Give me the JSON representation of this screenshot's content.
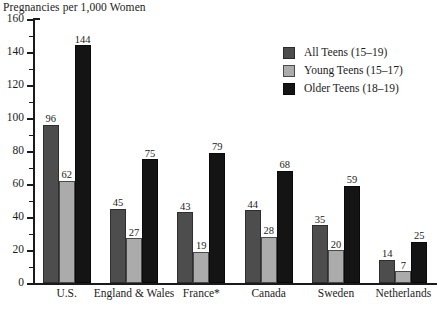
{
  "chart_data": {
    "type": "bar",
    "title": "Pregnancies per 1,000 Women",
    "xlabel": "",
    "ylabel": "",
    "ylim": [
      0,
      160
    ],
    "ytick_step": 20,
    "yticks": [
      0,
      20,
      40,
      60,
      80,
      100,
      120,
      140,
      160
    ],
    "ytick_labels": [
      "0",
      "20",
      "40",
      "60",
      "80",
      "100",
      "120",
      "140",
      "160"
    ],
    "minor_tick_step": 10,
    "grid": false,
    "legend_position": "upper right",
    "categories": [
      "U.S.",
      "England & Wales",
      "France*",
      "Canada",
      "Sweden",
      "Netherlands"
    ],
    "series": [
      {
        "name": "All Teens (15–19)",
        "color": "#4d4d4d",
        "values": [
          96,
          45,
          43,
          44,
          35,
          14
        ]
      },
      {
        "name": "Young Teens (15–17)",
        "color": "#ababab",
        "values": [
          62,
          27,
          19,
          28,
          20,
          7
        ]
      },
      {
        "name": "Older Teens (18–19)",
        "color": "#141414",
        "values": [
          144,
          75,
          79,
          68,
          59,
          25
        ]
      }
    ],
    "annotations": [
      "France*"
    ]
  },
  "legend": {
    "items": [
      {
        "label": "All Teens (15–19)",
        "swatch": "all"
      },
      {
        "label": "Young Teens (15–17)",
        "swatch": "young"
      },
      {
        "label": "Older Teens (18–19)",
        "swatch": "older"
      }
    ]
  },
  "colors": {
    "all_teens": "#4d4d4d",
    "young_teens": "#ababab",
    "older_teens": "#141414",
    "axis": "#1a1a1a",
    "background": "#ffffff"
  }
}
